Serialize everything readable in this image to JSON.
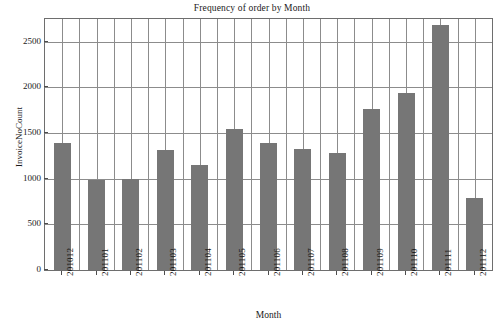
{
  "chart_data": {
    "type": "bar",
    "title": "Frequency of order by Month",
    "xlabel": "Month",
    "ylabel": "InvoiceNoCount",
    "categories": [
      "201012",
      "201101",
      "201102",
      "201103",
      "201104",
      "201105",
      "201106",
      "201107",
      "201108",
      "201109",
      "201110",
      "201111",
      "201112"
    ],
    "values": [
      1390,
      985,
      995,
      1310,
      1145,
      1540,
      1390,
      1330,
      1285,
      1765,
      1935,
      2680,
      790
    ],
    "ylim": [
      0,
      2750
    ],
    "yticks": [
      0,
      500,
      1000,
      1500,
      2000,
      2500
    ],
    "ytick_labels": [
      "0",
      "500",
      "1000",
      "1500",
      "2000",
      "2500"
    ],
    "grid": true,
    "grid_axes": "both",
    "legend": "none",
    "bar_color": "#767676",
    "grid_color": "#8c8c8c",
    "frame_color": "#6e6e6e",
    "background": "#ffffff"
  }
}
